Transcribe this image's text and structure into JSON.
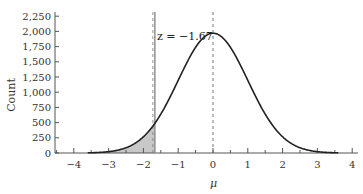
{
  "chart_data": {
    "type": "line",
    "title": "",
    "xlabel": "μ",
    "ylabel": "Count",
    "xlim": [
      -4.6,
      4.1
    ],
    "ylim": [
      0,
      2250
    ],
    "x_ticks": [
      -4,
      -3,
      -2,
      -1,
      0,
      1,
      2,
      3,
      4
    ],
    "x_tick_labels": [
      "−4",
      "−3",
      "−2",
      "−1",
      "0",
      "1",
      "2",
      "3",
      "4"
    ],
    "y_ticks": [
      0,
      250,
      500,
      750,
      1000,
      1250,
      1500,
      1750,
      2000,
      2250
    ],
    "y_tick_labels": [
      "0",
      "250",
      "500",
      "750",
      "1,000",
      "1,250",
      "1,500",
      "1,750",
      "2,000",
      "2,250"
    ],
    "grid": false,
    "legend": null,
    "series": [
      {
        "name": "normal curve",
        "description": "Bell-shaped curve centered at μ = 0, peak ≈ 1,970",
        "x": [
          -3.6,
          -3.0,
          -2.5,
          -2.0,
          -1.67,
          -1.5,
          -1.0,
          -0.5,
          0.0,
          0.5,
          1.0,
          1.5,
          2.0,
          2.5,
          3.0,
          3.6
        ],
        "values": [
          12,
          55,
          160,
          380,
          490,
          640,
          1190,
          1740,
          1970,
          1740,
          1190,
          640,
          380,
          160,
          55,
          12
        ]
      }
    ],
    "annotations": [
      {
        "type": "vline",
        "x": -1.67,
        "style": "solid-gray",
        "label": "z = −1.67"
      },
      {
        "type": "vline",
        "x": 0,
        "style": "dashed",
        "label": ""
      },
      {
        "type": "shaded_area",
        "from_x": -3.6,
        "to_x": -1.67,
        "color": "#c8c8c8",
        "label": "left tail"
      }
    ]
  },
  "labels": {
    "ylabel": "Count",
    "xlabel": "μ",
    "z_annotation": "z = −1.67"
  },
  "colors": {
    "curve": "#222222",
    "shade": "#c8c8c8",
    "axis": "#555555",
    "zline": "#8a8a8a"
  }
}
